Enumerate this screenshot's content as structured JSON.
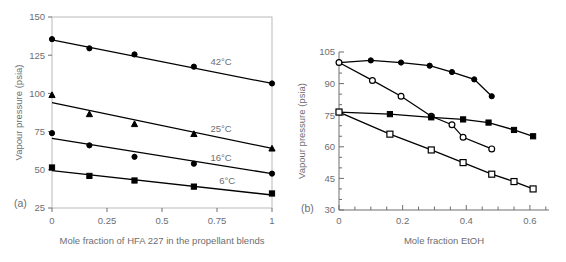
{
  "figure": {
    "panel_a_tag": "(a)",
    "panel_b_tag": "(b)"
  },
  "chart_data": [
    {
      "type": "line",
      "panel": "(a)",
      "title": "",
      "xlabel": "Mole fraction of HFA 227 in the propellant blends",
      "ylabel": "Vapour pressure (psia)",
      "xlim": [
        0,
        1
      ],
      "ylim": [
        25,
        150
      ],
      "xticks": [
        0,
        0.25,
        0.5,
        0.75,
        1
      ],
      "xticklabels": [
        "0",
        "0.25",
        "0.5",
        "0.75",
        "1"
      ],
      "yticks": [
        25,
        50,
        75,
        100,
        125,
        150
      ],
      "yticklabels": [
        "25",
        "50",
        "75",
        "100",
        "125",
        "150"
      ],
      "grid": false,
      "legend": "inline-annotations",
      "series": [
        {
          "name": "42°C",
          "label": "42°C",
          "marker": "filled-circle",
          "x": [
            0,
            0.17,
            0.375,
            0.645,
            1
          ],
          "y": [
            135.5,
            129.5,
            125.5,
            117.5,
            106.5
          ],
          "fit_endpoints": {
            "x": [
              0,
              1
            ],
            "y": [
              135.0,
              106.5
            ]
          },
          "label_x": 0.72,
          "label_y": 118.5
        },
        {
          "name": "25°C",
          "label": "25°C",
          "marker": "filled-triangle",
          "x": [
            0,
            0.17,
            0.375,
            0.645,
            1
          ],
          "y": [
            99.0,
            86.5,
            80.0,
            73.5,
            64.0
          ],
          "fit_endpoints": {
            "x": [
              0,
              1
            ],
            "y": [
              94.0,
              64.0
            ]
          },
          "label_x": 0.72,
          "label_y": 74.5
        },
        {
          "name": "16°C",
          "label": "16°C",
          "marker": "filled-circle",
          "x": [
            0,
            0.17,
            0.375,
            0.645,
            1
          ],
          "y": [
            74.0,
            66.0,
            58.5,
            54.0,
            47.5
          ],
          "fit_endpoints": {
            "x": [
              0,
              1
            ],
            "y": [
              70.5,
              47.5
            ]
          },
          "label_x": 0.72,
          "label_y": 55.5
        },
        {
          "name": "6°C",
          "label": "6°C",
          "marker": "filled-square",
          "x": [
            0,
            0.17,
            0.375,
            0.645,
            1
          ],
          "y": [
            51.5,
            46.0,
            43.0,
            39.0,
            34.5
          ],
          "fit_endpoints": {
            "x": [
              0,
              1
            ],
            "y": [
              49.5,
              33.5
            ]
          },
          "label_x": 0.76,
          "label_y": 41.0
        }
      ]
    },
    {
      "type": "line",
      "panel": "(b)",
      "title": "",
      "xlabel": "Mole fraction EtOH",
      "ylabel": "Vapour pressure (psia)",
      "xlim": [
        0,
        0.66
      ],
      "ylim": [
        30,
        105
      ],
      "xticks": [
        0,
        0.2,
        0.4,
        0.6
      ],
      "xticklabels": [
        "0",
        "0.2",
        "0.4",
        "0.6"
      ],
      "xminorticks": [
        0.05,
        0.1,
        0.15,
        0.25,
        0.3,
        0.35,
        0.45,
        0.5,
        0.55,
        0.65
      ],
      "yticks": [
        30,
        45,
        60,
        75,
        90,
        105
      ],
      "yticklabels": [
        "30",
        "45",
        "60",
        "75",
        "90",
        "105"
      ],
      "yminorticks": [
        35,
        40,
        50,
        55,
        65,
        70,
        80,
        85,
        95,
        100
      ],
      "grid": false,
      "legend": "none",
      "series": [
        {
          "name": "series-1",
          "marker": "filled-circle",
          "x": [
            0,
            0.1,
            0.195,
            0.285,
            0.355,
            0.425,
            0.48
          ],
          "y": [
            100.0,
            101.0,
            100.0,
            98.5,
            95.5,
            92.0,
            84.0
          ]
        },
        {
          "name": "series-2",
          "marker": "open-circle",
          "x": [
            0,
            0.105,
            0.195,
            0.29,
            0.355,
            0.39,
            0.48
          ],
          "y": [
            100.0,
            91.5,
            84.0,
            74.5,
            70.5,
            64.5,
            59.0
          ]
        },
        {
          "name": "series-3",
          "marker": "filled-square",
          "x": [
            0,
            0.16,
            0.29,
            0.39,
            0.47,
            0.55,
            0.61
          ],
          "y": [
            76.5,
            75.5,
            74.0,
            73.0,
            71.5,
            68.0,
            65.0
          ]
        },
        {
          "name": "series-4",
          "marker": "open-square",
          "x": [
            0,
            0.16,
            0.29,
            0.39,
            0.48,
            0.55,
            0.61
          ],
          "y": [
            76.5,
            66.0,
            58.5,
            52.5,
            47.0,
            43.5,
            40.0
          ]
        }
      ]
    }
  ]
}
